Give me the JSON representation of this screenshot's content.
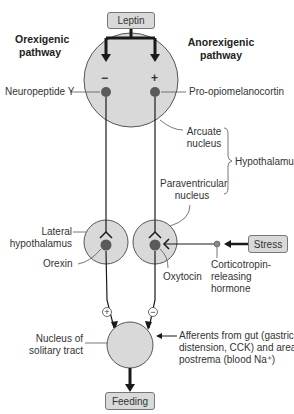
{
  "diagram": {
    "boxes": {
      "leptin": "Leptin",
      "stress": "Stress",
      "feeding": "Feeding"
    },
    "pathways": {
      "orexigenic": [
        "Orexigenic",
        "pathway"
      ],
      "anorexigenic": [
        "Anorexigenic",
        "pathway"
      ]
    },
    "labels": {
      "npy": "Neuropeptide Y",
      "pomc": "Pro-opiomelanocortin",
      "arcuate": [
        "Arcuate",
        "nucleus"
      ],
      "hypothalamus": "Hypothalamus",
      "paraventricular": [
        "Paraventricular",
        "nucleus"
      ],
      "lateral": [
        "Lateral",
        "hypothalamus"
      ],
      "orexin": "Orexin",
      "oxytocin": "Oxytocin",
      "crh": [
        "Corticotropin-",
        "releasing",
        "hormone"
      ],
      "nts": [
        "Nucleus of",
        "solitary tract"
      ],
      "afferents": [
        "Afferents from gut (gastric",
        "distension, CCK) and area",
        "postrema (blood Na⁺)"
      ]
    },
    "signs": {
      "npy_sign": "−",
      "pomc_sign": "+",
      "orexin_to_nts": "+",
      "oxytocin_to_nts": "−"
    },
    "colors": {
      "nucleus_fill": "#d9d9d9",
      "neuron_fill": "#5a5a5a",
      "line": "#1a1a1a",
      "box_fill": "#d9d9d9"
    }
  }
}
